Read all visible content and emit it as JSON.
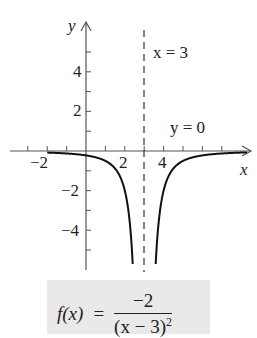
{
  "chart_data": {
    "type": "line",
    "title": "",
    "function": "f(x) = -2/(x-3)^2",
    "xlabel": "x",
    "ylabel": "y",
    "xlim": [
      -3.5,
      8.5
    ],
    "ylim": [
      -6,
      6.5
    ],
    "x_ticks": [
      -3,
      -2,
      -1,
      1,
      2,
      3,
      4,
      5,
      6,
      7
    ],
    "x_tick_labels": {
      "-2": "−2",
      "2": "2",
      "4": "4"
    },
    "y_ticks": [
      -5,
      -4,
      -3,
      -2,
      -1,
      1,
      2,
      3,
      4,
      5
    ],
    "y_tick_labels": {
      "4": "4",
      "2": "2",
      "-2": "−2",
      "-4": "−4"
    },
    "grid": false,
    "series": [
      {
        "name": "f(x)",
        "x": [
          -2,
          -1,
          0,
          1,
          2,
          2.5,
          2.42,
          3.58,
          4,
          5,
          6,
          7,
          8
        ],
        "y": [
          -0.08,
          -0.125,
          -0.222,
          -0.5,
          -2,
          -8,
          -6,
          -6,
          -2,
          -0.5,
          -0.222,
          -0.125,
          -0.08
        ]
      }
    ],
    "asymptotes": [
      {
        "type": "vertical",
        "value": 3,
        "label": "x = 3",
        "style": "dashed"
      },
      {
        "type": "horizontal",
        "value": 0,
        "label": "y = 0"
      }
    ],
    "annotations": [
      "x = 3",
      "y = 0"
    ]
  },
  "labels": {
    "y_axis": "y",
    "x_axis": "x",
    "vertical_asymptote": "x = 3",
    "horizontal_asymptote": "y = 0",
    "tick_x_neg2": "−2",
    "tick_x_2": "2",
    "tick_x_4": "4",
    "tick_y_4": "4",
    "tick_y_2": "2",
    "tick_y_neg2": "−2",
    "tick_y_neg4": "−4"
  },
  "formula": {
    "lhs": "f(x)",
    "equals": "=",
    "numerator": "−2",
    "denominator_base": "(x − 3)",
    "denominator_exp": "2"
  },
  "colors": {
    "curve": "#111111",
    "axes": "#555555",
    "formula_background": "#e9e9e9"
  }
}
